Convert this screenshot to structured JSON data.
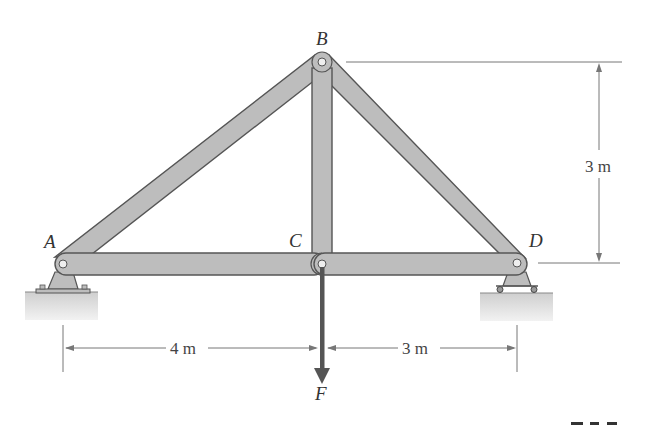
{
  "figure": {
    "type": "truss",
    "joints": [
      {
        "id": "A",
        "label": "A",
        "support": "pin"
      },
      {
        "id": "B",
        "label": "B",
        "support": "none"
      },
      {
        "id": "C",
        "label": "C",
        "support": "none"
      },
      {
        "id": "D",
        "label": "D",
        "support": "roller"
      }
    ],
    "members": [
      "AB",
      "BC",
      "BD",
      "AC",
      "CD"
    ],
    "load": {
      "label": "F",
      "joint": "C",
      "direction": "down"
    },
    "dimensions": {
      "height": "3 m",
      "left_span": "4 m",
      "right_span": "3 m"
    },
    "figure_number_partial": "F6-6"
  },
  "colors": {
    "member_fill": "#bdbdbd",
    "member_outline": "#555555",
    "force_arrow": "#555555",
    "dimension_line": "#777777",
    "ground": "#d8d8d8"
  }
}
